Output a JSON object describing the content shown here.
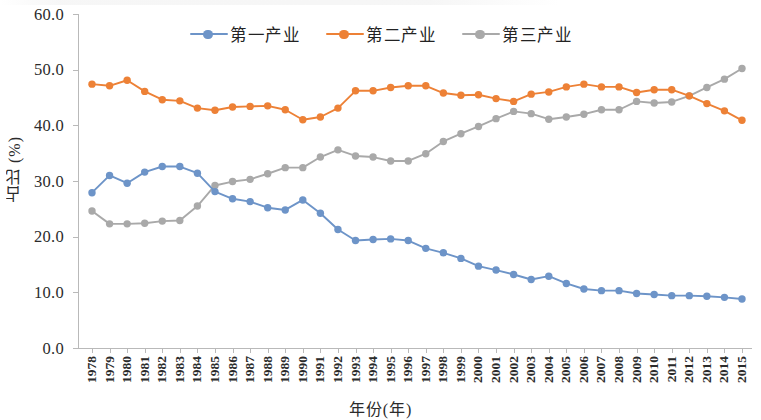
{
  "axes": {
    "ylabel": "占比 (%)",
    "xlabel": "年份(年)",
    "yticks": [
      "0.0",
      "10.0",
      "20.0",
      "30.0",
      "40.0",
      "50.0",
      "60.0"
    ]
  },
  "legend": {
    "items": [
      {
        "label": "第一产业",
        "color": "#6d94c8"
      },
      {
        "label": "第二产业",
        "color": "#ed8136"
      },
      {
        "label": "第三产业",
        "color": "#a9a9a9"
      }
    ]
  },
  "chart_data": {
    "type": "line",
    "title": "",
    "xlabel": "年份(年)",
    "ylabel": "占比 (%)",
    "ylim": [
      0,
      60
    ],
    "ytick_step": 10,
    "grid": false,
    "legend_position": "top-center",
    "x": [
      1978,
      1979,
      1980,
      1981,
      1982,
      1983,
      1984,
      1985,
      1986,
      1987,
      1988,
      1989,
      1990,
      1991,
      1992,
      1993,
      1994,
      1995,
      1996,
      1997,
      1998,
      1999,
      2000,
      2001,
      2002,
      2003,
      2004,
      2005,
      2006,
      2007,
      2008,
      2009,
      2010,
      2011,
      2012,
      2013,
      2014,
      2015
    ],
    "series": [
      {
        "name": "第一产业",
        "color": "#6d94c8",
        "values": [
          27.9,
          31.0,
          29.6,
          31.6,
          32.6,
          32.6,
          31.4,
          28.1,
          26.8,
          26.3,
          25.2,
          24.8,
          26.6,
          24.2,
          21.3,
          19.3,
          19.5,
          19.6,
          19.3,
          17.9,
          17.1,
          16.1,
          14.7,
          14.0,
          13.2,
          12.3,
          12.9,
          11.6,
          10.6,
          10.3,
          10.3,
          9.8,
          9.6,
          9.4,
          9.4,
          9.3,
          9.1,
          8.8
        ]
      },
      {
        "name": "第二产业",
        "color": "#ed8136",
        "values": [
          47.4,
          47.1,
          48.1,
          46.1,
          44.6,
          44.4,
          43.1,
          42.7,
          43.3,
          43.4,
          43.5,
          42.8,
          41.0,
          41.5,
          43.1,
          46.2,
          46.2,
          46.8,
          47.1,
          47.1,
          45.8,
          45.4,
          45.5,
          44.8,
          44.3,
          45.6,
          46.0,
          46.9,
          47.4,
          46.9,
          46.9,
          45.9,
          46.4,
          46.4,
          45.3,
          43.9,
          42.6,
          40.9
        ]
      },
      {
        "name": "第三产业",
        "color": "#a9a9a9",
        "values": [
          24.6,
          22.3,
          22.3,
          22.4,
          22.8,
          22.9,
          25.5,
          29.2,
          29.9,
          30.3,
          31.3,
          32.4,
          32.4,
          34.3,
          35.6,
          34.5,
          34.3,
          33.6,
          33.6,
          34.9,
          37.1,
          38.5,
          39.8,
          41.2,
          42.5,
          42.1,
          41.1,
          41.5,
          42.0,
          42.8,
          42.8,
          44.3,
          44.0,
          44.2,
          45.3,
          46.8,
          48.3,
          50.2
        ]
      }
    ]
  }
}
